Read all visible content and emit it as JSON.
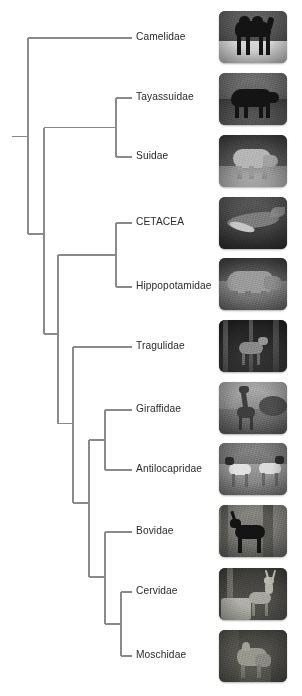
{
  "figure": {
    "type": "cladogram",
    "title": "",
    "line_color": "#8a8a8a",
    "label_color": "#2b2b2b",
    "background": "#ffffff"
  },
  "tips": [
    {
      "id": "camelidae",
      "label": "Camelidae",
      "y": 38,
      "label_x": 136,
      "thumb": {
        "y": 11,
        "subject": "camel",
        "palette": [
          "#4a4a4a",
          "#d8d8d8",
          "#1a1a1a"
        ]
      }
    },
    {
      "id": "tayassuidae",
      "label": "Tayassuidae",
      "y": 98,
      "label_x": 136,
      "thumb": {
        "y": 73,
        "subject": "peccary",
        "palette": [
          "#3d3d3d",
          "#8e8e8e",
          "#101010"
        ]
      }
    },
    {
      "id": "suidae",
      "label": "Suidae",
      "y": 157,
      "label_x": 136,
      "thumb": {
        "y": 135,
        "subject": "pig",
        "palette": [
          "#5a5a5a",
          "#b9b9b9",
          "#2a2a2a"
        ]
      }
    },
    {
      "id": "cetacea",
      "label": "CETACEA",
      "y": 223,
      "label_x": 136,
      "thumb": {
        "y": 197,
        "subject": "whale",
        "palette": [
          "#3a3a3a",
          "#777777",
          "#161616"
        ]
      }
    },
    {
      "id": "hippopotamidae",
      "label": "Hippopotamidae",
      "y": 287,
      "label_x": 136,
      "thumb": {
        "y": 258,
        "subject": "hippopotamus",
        "palette": [
          "#5f5f5f",
          "#9d9d9d",
          "#2c2c2c"
        ]
      }
    },
    {
      "id": "tragulidae",
      "label": "Tragulidae",
      "y": 347,
      "label_x": 136,
      "thumb": {
        "y": 320,
        "subject": "chevrotain",
        "palette": [
          "#2e2e2e",
          "#707070",
          "#0d0d0d"
        ]
      }
    },
    {
      "id": "giraffidae",
      "label": "Giraffidae",
      "y": 410,
      "label_x": 136,
      "thumb": {
        "y": 382,
        "subject": "giraffe",
        "palette": [
          "#6a6a6a",
          "#a8a8a8",
          "#333333"
        ]
      }
    },
    {
      "id": "antilocapridae",
      "label": "Antilocapridae",
      "y": 470,
      "label_x": 136,
      "thumb": {
        "y": 443,
        "subject": "pronghorn",
        "palette": [
          "#6d6d6d",
          "#c2c2c2",
          "#2f2f2f"
        ]
      }
    },
    {
      "id": "bovidae",
      "label": "Bovidae",
      "y": 532,
      "label_x": 136,
      "thumb": {
        "y": 505,
        "subject": "antelope",
        "palette": [
          "#55544f",
          "#8f8f87",
          "#0f0f0f"
        ]
      }
    },
    {
      "id": "cervidae",
      "label": "Cervidae",
      "y": 592,
      "label_x": 136,
      "thumb": {
        "y": 568,
        "subject": "deer",
        "palette": [
          "#4e4c46",
          "#93918a",
          "#1c1c18"
        ]
      }
    },
    {
      "id": "moschidae",
      "label": "Moschidae",
      "y": 656,
      "label_x": 136,
      "thumb": {
        "y": 630,
        "subject": "musk-deer",
        "palette": [
          "#514f49",
          "#8a887f",
          "#191915"
        ]
      }
    }
  ],
  "geometry": {
    "root_stub_x1": 12,
    "tip_line_end_x": 132,
    "thumb_x": 219,
    "thumb_w": 68,
    "thumb_h": 52
  },
  "nodes": [
    {
      "id": "root",
      "x": 28,
      "y_top": 38,
      "y_bottom": 235,
      "children": [
        "camelidae",
        "n-artiodactyla"
      ]
    },
    {
      "id": "n-artiodactyla",
      "x": 44,
      "y_top": 128,
      "y_bottom": 340,
      "children": [
        "n-suina",
        "n-cetruminantia"
      ]
    },
    {
      "id": "n-suina",
      "x": 116,
      "y_top": 98,
      "y_bottom": 157,
      "children": [
        "tayassuidae",
        "suidae"
      ]
    },
    {
      "id": "n-cetruminantia",
      "x": 58,
      "y_top": 253,
      "y_bottom": 415,
      "children": [
        "n-whippomorpha",
        "n-ruminantia"
      ]
    },
    {
      "id": "n-whippomorpha",
      "x": 116,
      "y_top": 223,
      "y_bottom": 287,
      "children": [
        "cetacea",
        "hippopotamidae"
      ]
    },
    {
      "id": "n-ruminantia",
      "x": 73,
      "y_top": 347,
      "y_bottom": 500,
      "children": [
        "tragulidae",
        "n-pecora"
      ]
    },
    {
      "id": "n-pecora",
      "x": 89,
      "y_top": 440,
      "y_bottom": 566,
      "children": [
        "n-giraffoidea",
        "n-bovid-cervid"
      ]
    },
    {
      "id": "n-giraffoidea",
      "x": 105,
      "y_top": 410,
      "y_bottom": 470,
      "children": [
        "giraffidae",
        "antilocapridae"
      ]
    },
    {
      "id": "n-bovid-cervid",
      "x": 105,
      "y_top": 532,
      "y_bottom": 622,
      "children": [
        "bovidae",
        "n-cervoidea"
      ]
    },
    {
      "id": "n-cervoidea",
      "x": 121,
      "y_top": 592,
      "y_bottom": 656,
      "children": [
        "cervidae",
        "moschidae"
      ]
    }
  ]
}
